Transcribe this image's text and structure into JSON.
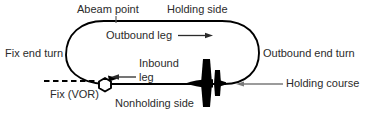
{
  "diagram": {
    "colors": {
      "track": "#000000",
      "text": "#2b2b2b",
      "leader": "#6e6e6e",
      "aircraft": "#000000",
      "background": "#ffffff"
    },
    "labels": {
      "abeam_point": "Abeam point",
      "holding_side": "Holding side",
      "outbound_leg": "Outbound leg",
      "fix_end_turn": "Fix end turn",
      "outbound_end_turn": "Outbound end turn",
      "inbound_leg_line1": "Inbound",
      "inbound_leg_line2": "leg",
      "fix_vor": "Fix (VOR)",
      "nonholding_side": "Nonholding side",
      "holding_course": "Holding course"
    },
    "symbols": {
      "fix": "vor-hexagon-icon",
      "aircraft": "aircraft-plan-icon",
      "outbound_arrow": "arrow-right-icon",
      "inbound_arrow": "arrow-left-icon",
      "course_arrow": "arrow-left-icon",
      "radial": "dashed-radial-line"
    }
  }
}
